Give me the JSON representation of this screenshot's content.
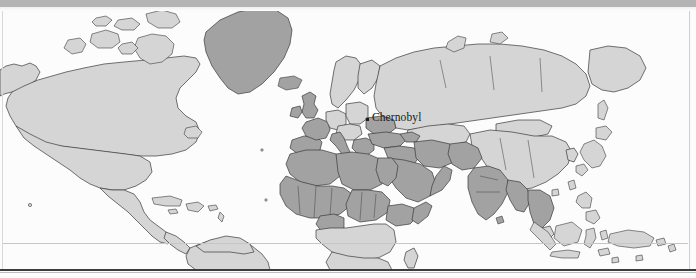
{
  "figure": {
    "type": "world-map",
    "projection": "equirectangular",
    "title": "",
    "colors": {
      "land_light": "#d5d5d5",
      "land_dark": "#a2a2a2",
      "land_pale": "#e6e6e6",
      "ocean": "#fcfcfc",
      "outline": "#3a3a3a",
      "top_border": "#b4b4b4",
      "bottom_rule": "#3c3c3c",
      "grid_line": "#c6c6c6",
      "label_text": "#1b1b1b",
      "marker": "#1e1e1e"
    },
    "shading_legend": {
      "dark_regions": [
        "Greenland",
        "United Kingdom",
        "Ireland",
        "France",
        "Spain",
        "Portugal",
        "Italy",
        "Greece",
        "Turkey",
        "Morocco",
        "Algeria",
        "Tunisia",
        "Libya",
        "Egypt",
        "Sudan",
        "Chad",
        "Niger",
        "Mali",
        "Mauritania",
        "Senegal",
        "Guinea",
        "Nigeria",
        "Ethiopia",
        "Somalia",
        "Saudi Arabia",
        "Iraq",
        "Iran",
        "Syria",
        "Yemen",
        "Oman",
        "Pakistan",
        "India",
        "Bangladesh",
        "Myanmar",
        "Thailand",
        "Vietnam",
        "Ukraine"
      ],
      "light_regions": [
        "Canada",
        "United States",
        "Mexico",
        "Central America",
        "Caribbean",
        "South America",
        "Russia",
        "Scandinavia",
        "Germany",
        "Poland",
        "Central Europe",
        "Kazakhstan",
        "Mongolia",
        "China",
        "Japan",
        "Korea",
        "Indonesia",
        "Philippines",
        "Papua New Guinea",
        "Southern Africa"
      ]
    }
  },
  "annotations": {
    "chernobyl": {
      "label": "Chernobyl",
      "marker": "point-marker",
      "x_px": 370,
      "y_px": 119
    }
  },
  "grid": {
    "equator_label": "",
    "equator_y_px": 243
  }
}
